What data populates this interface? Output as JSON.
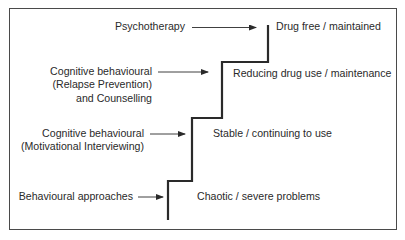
{
  "diagram": {
    "type": "staircase",
    "steps": [
      {
        "level": 1,
        "intervention": [
          "Behavioural approaches"
        ],
        "stage": "Chaotic / severe problems"
      },
      {
        "level": 2,
        "intervention": [
          "Cognitive behavioural",
          "(Motivational Interviewing)"
        ],
        "stage": "Stable / continuing to use"
      },
      {
        "level": 3,
        "intervention": [
          "Cognitive behavioural",
          "(Relapse Prevention)",
          "and Counselling"
        ],
        "stage": "Reducing drug use / maintenance"
      },
      {
        "level": 4,
        "intervention": [
          "Psychotherapy"
        ],
        "stage": "Drug free / maintained"
      }
    ],
    "colors": {
      "line": "#2a2a2a",
      "border": "#4a4a4a",
      "text": "#2a2a2a",
      "background": "#ffffff"
    }
  }
}
